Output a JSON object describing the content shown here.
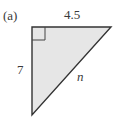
{
  "figure": {
    "part_label": "(a)",
    "shape": "right-triangle",
    "fill_color": "#e6e6e6",
    "stroke_color": "#333333",
    "sides": {
      "top": "4.5",
      "left": "7",
      "hypotenuse": "n"
    },
    "right_angle_marker": true
  }
}
